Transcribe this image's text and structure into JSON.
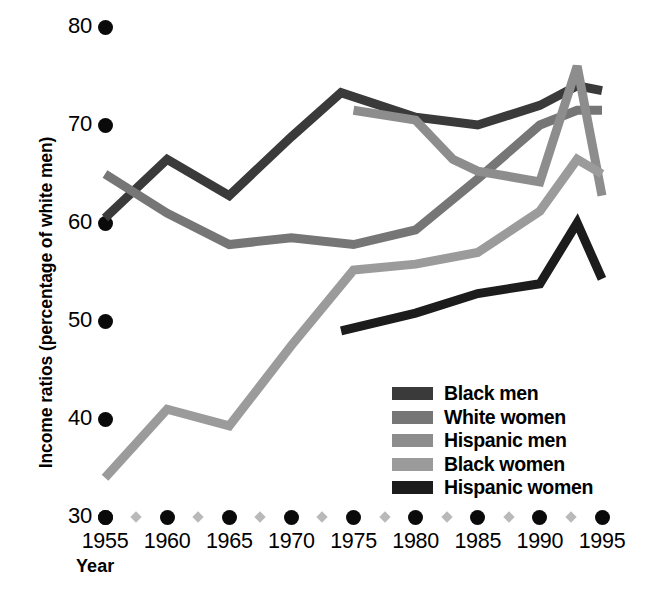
{
  "chart_data": {
    "type": "line",
    "title": "",
    "xlabel": "Year",
    "ylabel": "Income ratios (percentage of white men)",
    "xlim": [
      1955,
      1995
    ],
    "ylim": [
      30,
      80
    ],
    "grid": false,
    "legend_position": "inside-lower-right",
    "x_tick_labels": [
      "1955",
      "1960",
      "1965",
      "1970",
      "1975",
      "1980",
      "1985",
      "1990",
      "1995"
    ],
    "y_tick_labels": [
      "30",
      "40",
      "50",
      "60",
      "70",
      "80"
    ],
    "x_ticks": [
      1955,
      1960,
      1965,
      1970,
      1975,
      1980,
      1985,
      1990,
      1995
    ],
    "y_ticks": [
      30,
      40,
      50,
      60,
      70,
      80
    ],
    "minor_x_ticks": [
      1957.5,
      1962.5,
      1967.5,
      1972.5,
      1977.5,
      1982.5,
      1987.5,
      1992.5
    ],
    "series": [
      {
        "name": "Black men",
        "color": "#3a3a3a",
        "x": [
          1955,
          1960,
          1965,
          1970,
          1974,
          1980,
          1985,
          1990,
          1993,
          1995
        ],
        "values": [
          60.5,
          66.5,
          62.8,
          68.8,
          73.3,
          70.8,
          70.0,
          72.0,
          74.0,
          73.5
        ]
      },
      {
        "name": "White women",
        "color": "#767676",
        "x": [
          1955,
          1960,
          1965,
          1970,
          1975,
          1980,
          1985,
          1990,
          1993,
          1995
        ],
        "values": [
          65.0,
          61.0,
          57.8,
          58.5,
          57.8,
          59.3,
          64.5,
          70.0,
          71.5,
          71.5
        ]
      },
      {
        "name": "Hispanic men",
        "color": "#8d8d8d",
        "x": [
          1975,
          1980,
          1983,
          1985,
          1990,
          1993,
          1995
        ],
        "values": [
          71.5,
          70.5,
          66.5,
          65.3,
          64.2,
          76.0,
          62.8
        ]
      },
      {
        "name": "Black women",
        "color": "#9b9b9b",
        "x": [
          1955,
          1960,
          1965,
          1970,
          1975,
          1980,
          1985,
          1990,
          1993,
          1995
        ],
        "values": [
          34.0,
          41.0,
          39.3,
          47.5,
          55.2,
          55.8,
          57.0,
          61.2,
          66.5,
          65.0
        ]
      },
      {
        "name": "Hispanic women",
        "color": "#1c1c1c",
        "x": [
          1974,
          1980,
          1985,
          1990,
          1993,
          1995
        ],
        "values": [
          49.0,
          50.8,
          52.8,
          53.8,
          60.0,
          54.3
        ]
      }
    ]
  },
  "legend": {
    "items": [
      {
        "label": "Black men",
        "color": "#3a3a3a"
      },
      {
        "label": "White women",
        "color": "#767676"
      },
      {
        "label": "Hispanic men",
        "color": "#8d8d8d"
      },
      {
        "label": "Black women",
        "color": "#9b9b9b"
      },
      {
        "label": "Hispanic women",
        "color": "#1c1c1c"
      }
    ]
  },
  "axes": {
    "y_title": "Income ratios (percentage of white men)",
    "x_title": "Year"
  }
}
